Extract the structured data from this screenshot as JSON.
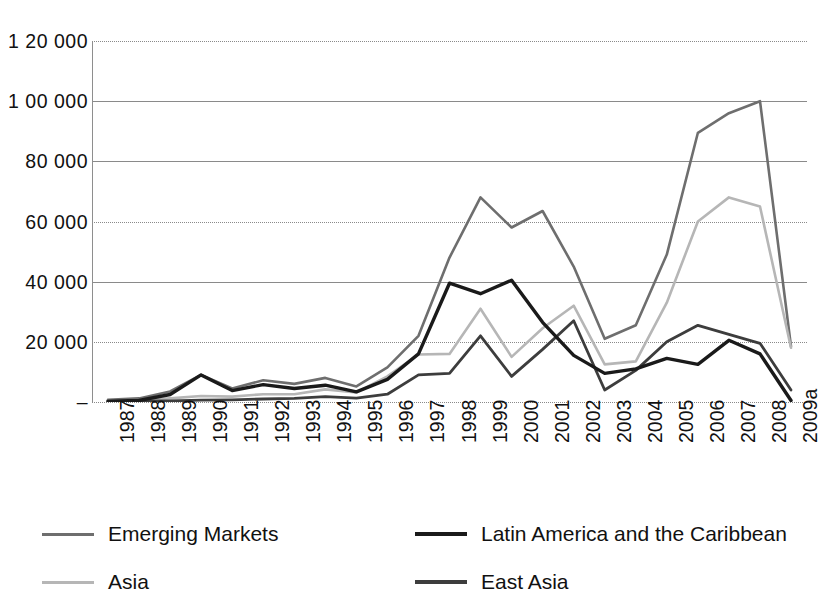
{
  "chart_data": {
    "type": "line",
    "title": "",
    "xlabel": "",
    "ylabel": "",
    "x": [
      "1987",
      "1988",
      "1989",
      "1990",
      "1991",
      "1992",
      "1993",
      "1994",
      "1995",
      "1996",
      "1997",
      "1998",
      "1999",
      "2000",
      "2001",
      "2002",
      "2003",
      "2004",
      "2005",
      "2006",
      "2007",
      "2008",
      "2009a"
    ],
    "ylim": [
      0,
      120000
    ],
    "ytick_labels": [
      "1 20 000",
      "1 00 000",
      "80 000",
      "60 000",
      "40 000",
      "20 000",
      "–"
    ],
    "ytick_values": [
      120000,
      100000,
      80000,
      60000,
      40000,
      20000,
      0
    ],
    "grid": true,
    "legend_position": "bottom",
    "series": [
      {
        "name": "Emerging Markets",
        "color": "#6e6e6e",
        "width": 2.6,
        "values": [
          700,
          1200,
          3500,
          9000,
          4500,
          7200,
          6000,
          8000,
          5200,
          11500,
          22000,
          48000,
          68000,
          58000,
          63500,
          45000,
          21000,
          25500,
          49000,
          89500,
          96000,
          100000,
          18500
        ]
      },
      {
        "name": "Asia",
        "color": "#b6b6b6",
        "width": 2.6,
        "values": [
          400,
          600,
          1200,
          2000,
          1800,
          2600,
          2600,
          4200,
          3200,
          8500,
          15800,
          16000,
          31000,
          15000,
          24500,
          32000,
          12500,
          13500,
          33000,
          60000,
          68000,
          65000,
          18000
        ]
      },
      {
        "name": "Latin America and the Caribbean",
        "color": "#1a1a1a",
        "width": 3.4,
        "values": [
          300,
          500,
          2500,
          9000,
          3800,
          5800,
          4500,
          5600,
          3400,
          7500,
          16000,
          39500,
          36000,
          40500,
          26500,
          15500,
          9500,
          11000,
          14500,
          12500,
          20500,
          16000,
          500
        ]
      },
      {
        "name": "East Asia",
        "color": "#3d3d3d",
        "width": 2.8,
        "values": [
          200,
          300,
          400,
          600,
          700,
          1000,
          1200,
          1800,
          1300,
          2600,
          9000,
          9500,
          22000,
          8500,
          17500,
          27000,
          4000,
          10500,
          20000,
          25500,
          22500,
          19500,
          4000
        ]
      }
    ]
  },
  "legend": {
    "items": [
      {
        "label": "Emerging Markets",
        "color": "#6e6e6e",
        "thickness": 3
      },
      {
        "label": "Latin America and the Caribbean",
        "color": "#1a1a1a",
        "thickness": 4
      },
      {
        "label": "Asia",
        "color": "#b6b6b6",
        "thickness": 3
      },
      {
        "label": "East Asia",
        "color": "#3d3d3d",
        "thickness": 4
      }
    ]
  }
}
